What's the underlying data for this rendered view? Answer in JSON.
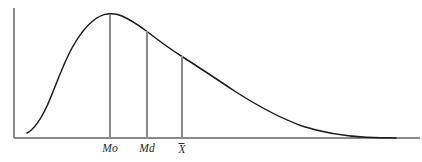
{
  "figure": {
    "background_color": "#ffffff",
    "width": 422,
    "height": 162
  },
  "axes": {
    "y_axis_name": "frequency-axis",
    "x_axis_name": "value-axis",
    "axis_color": "#8a8a8a",
    "y_axis": {
      "x": 14,
      "y_top": 8,
      "y_bottom": 138
    },
    "x_axis": {
      "y": 138,
      "x_left": 14,
      "x_right": 420
    }
  },
  "curve": {
    "color": "#1a1a1a",
    "stroke_width": 1.5,
    "path": "M 27 133 C 33 130 40 121 47 106 C 55 88 63 64 72 48 C 82 30 93 18 104 14.6 C 110 13 116 13.4 122 16 C 130 19.5 139 25.5 147 31.5 C 158 40 170 49 182 56.5 C 200 68 218 80 236 92 C 258 106 280 118 302 126 C 322 132.5 344 136 366 137.2 C 378 137.7 388 137.9 396 138"
  },
  "markers": [
    {
      "key": "mode",
      "label": "Mo",
      "label_type": "plain",
      "x": 110,
      "curve_y": 15,
      "baseline_y": 138,
      "description": "Mode - peak of the distribution"
    },
    {
      "key": "median",
      "label": "Md",
      "label_type": "plain",
      "x": 147,
      "curve_y": 31,
      "baseline_y": 138,
      "description": "Median"
    },
    {
      "key": "mean",
      "label": "X",
      "label_type": "overbar",
      "x": 182,
      "curve_y": 56,
      "baseline_y": 138,
      "description": "Mean - X with overbar"
    }
  ],
  "chart_data": {
    "type": "line",
    "title": "",
    "subtitle": "",
    "xlabel": "",
    "ylabel": "",
    "grid": false,
    "legend": null,
    "shape": "positively-skewed-unimodal-density",
    "annotations": [
      {
        "text": "Mo",
        "x": 110,
        "meaning": "mode"
      },
      {
        "text": "Md",
        "x": 147,
        "meaning": "median"
      },
      {
        "text": "X̄",
        "x": 182,
        "meaning": "mean"
      }
    ],
    "x": [
      27,
      40,
      55,
      72,
      90,
      104,
      110,
      122,
      135,
      147,
      160,
      175,
      182,
      200,
      220,
      240,
      262,
      285,
      310,
      340,
      370,
      396
    ],
    "y": [
      133,
      121,
      88,
      48,
      24,
      15,
      14.6,
      16,
      24,
      31.5,
      41,
      52,
      56.5,
      70,
      84,
      95,
      108,
      118,
      127,
      134,
      137.3,
      138
    ],
    "ylim": [
      138,
      8
    ],
    "xlim": [
      14,
      420
    ],
    "note": "y values are pixel coordinates measured downward from the top; smaller y = higher frequency"
  }
}
